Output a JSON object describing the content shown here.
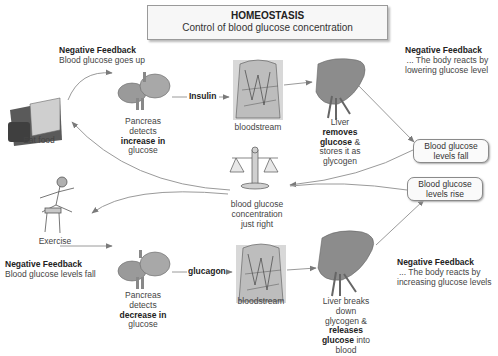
{
  "title": {
    "heading": "HOMEOSTASIS",
    "subheading": "Control of blood glucose concentration"
  },
  "top_left_feedback": {
    "heading": "Negative Feedback",
    "body": "Blood glucose goes up"
  },
  "top_right_feedback": {
    "heading": "Negative Feedback",
    "line1": "... The body reacts by",
    "line2": "lowering glucose level"
  },
  "bottom_left_feedback": {
    "heading": "Negative Feedback",
    "body": "Blood glucose levels fall"
  },
  "bottom_right_feedback": {
    "heading": "Negative Feedback",
    "line1": "... The body reacts by",
    "line2": "increasing glucose levels"
  },
  "eat_food": {
    "label": "Eat food",
    "icon": "food-tray-icon"
  },
  "exercise": {
    "label": "Exercise",
    "icon": "hurdler-icon"
  },
  "top_pancreas": {
    "icon": "pancreas-icon",
    "line1": "Pancreas",
    "line2": "detects",
    "line3_bold": "increase in",
    "line4": "glucose"
  },
  "bottom_pancreas": {
    "icon": "pancreas-icon",
    "line1": "Pancreas",
    "line2": "detects",
    "line3_bold": "decrease in",
    "line4": "glucose"
  },
  "hormones": {
    "top": "Insulin",
    "bottom": "glucagon"
  },
  "top_bloodstream": {
    "label": "bloodstream",
    "icon": "bloodstream-torso-icon"
  },
  "bottom_bloodstream": {
    "label": "bloodstream",
    "icon": "bloodstream-torso-icon"
  },
  "top_liver": {
    "icon": "liver-icon",
    "line1": "Liver",
    "line2_bold": "removes",
    "line3_bold": "glucose",
    "line3_rest": " &",
    "line4": "stores it as",
    "line5": "glycogen"
  },
  "bottom_liver": {
    "icon": "liver-icon",
    "line1": "Liver breaks",
    "line2": "down",
    "line3": "glycogen &",
    "line4_bold": "releases",
    "line5_bold": "glucose",
    "line5_rest": " into",
    "line6": "blood"
  },
  "balance": {
    "icon": "balance-scales-icon",
    "line1": "blood glucose",
    "line2": "concentration",
    "line3": "just right"
  },
  "status_boxes": {
    "fall_line1": "Blood glucose",
    "fall_line2": "levels fall",
    "rise_line1": "Blood glucose",
    "rise_line2": "levels rise"
  },
  "colors": {
    "organ_gray": "#8c8c8c",
    "arrow_gray": "#8a8a8a",
    "box_border": "#9a9a9a"
  }
}
